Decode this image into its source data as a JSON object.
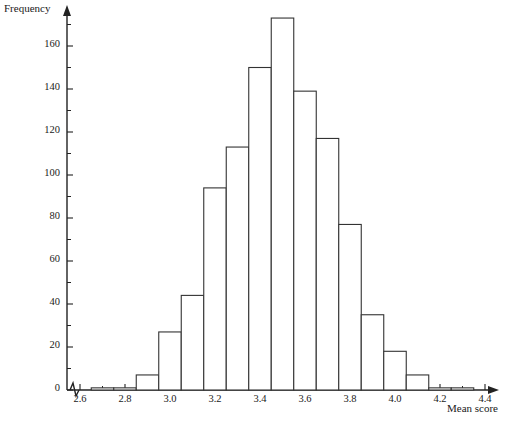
{
  "chart_data": {
    "type": "bar",
    "title": "",
    "subtitle": "",
    "xlabel": "Mean score",
    "ylabel": "Frequency",
    "grid": false,
    "legend": "none",
    "xlim": [
      2.55,
      4.45
    ],
    "ylim": [
      0,
      180
    ],
    "bin_width": 0.1,
    "x_ticks": [
      "2.6",
      "2.8",
      "3.0",
      "3.2",
      "3.4",
      "3.6",
      "3.8",
      "4.0",
      "4.2",
      "4.4"
    ],
    "x_tick_values": [
      2.6,
      2.8,
      3.0,
      3.2,
      3.4,
      3.6,
      3.8,
      4.0,
      4.2,
      4.4
    ],
    "x_minor_step": 0.1,
    "y_ticks": [
      "0",
      "20",
      "40",
      "60",
      "80",
      "100",
      "120",
      "140",
      "160"
    ],
    "y_tick_values": [
      0,
      20,
      40,
      60,
      80,
      100,
      120,
      140,
      160
    ],
    "y_minor_step": 10,
    "axis_break_on_x": true,
    "bin_edges": [
      2.55,
      2.65,
      2.75,
      2.85,
      2.95,
      3.05,
      3.15,
      3.25,
      3.35,
      3.45,
      3.55,
      3.65,
      3.75,
      3.85,
      3.95,
      4.05,
      4.15,
      4.25,
      4.35,
      4.45
    ],
    "categories": [
      "2.55-2.65",
      "2.65-2.75",
      "2.75-2.85",
      "2.85-2.95",
      "2.95-3.05",
      "3.05-3.15",
      "3.15-3.25",
      "3.25-3.35",
      "3.35-3.45",
      "3.45-3.55",
      "3.55-3.65",
      "3.65-3.75",
      "3.75-3.85",
      "3.85-3.95",
      "3.95-4.05",
      "4.05-4.15",
      "4.15-4.25",
      "4.25-4.35",
      "4.35-4.45"
    ],
    "values": [
      0,
      1,
      1,
      7,
      27,
      44,
      94,
      113,
      150,
      173,
      139,
      117,
      77,
      35,
      18,
      7,
      1,
      1,
      0
    ],
    "bar_fill": "#ffffff",
    "bar_stroke": "#333333",
    "axis_color": "#222222"
  },
  "axes": {
    "y_axis_label": "Frequency",
    "x_axis_label": "Mean score"
  }
}
